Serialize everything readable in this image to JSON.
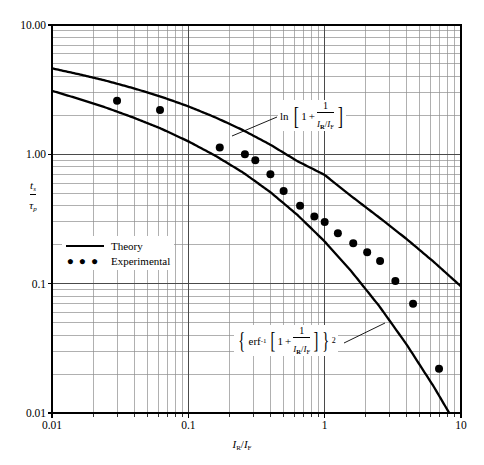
{
  "chart_data": {
    "type": "line",
    "title": "",
    "subtitle": "",
    "xlabel": "I_R/I_F",
    "ylabel": "t_s/tau_p",
    "xscale": "log",
    "yscale": "log",
    "xlim": [
      0.01,
      10
    ],
    "ylim": [
      0.01,
      10
    ],
    "grid": true,
    "grid_minor": true,
    "legend_position": "inside-left-center",
    "x_ticks": [
      "0.01",
      "0.1",
      "1",
      "10"
    ],
    "x_tick_values": [
      0.01,
      0.1,
      1,
      10
    ],
    "y_ticks": [
      "0.01",
      "0.1",
      "1.00",
      "10.00"
    ],
    "y_tick_values": [
      0.01,
      0.1,
      1.0,
      10.0
    ],
    "series": [
      {
        "name": "Theory",
        "kind": "line",
        "annotation": "ln[1 + 1/(I_R/I_F)]",
        "x": [
          0.01,
          0.0158,
          0.0251,
          0.0398,
          0.0631,
          0.1,
          0.158,
          0.251,
          0.398,
          0.631,
          1.0,
          1.58,
          2.51,
          3.98,
          6.31,
          10.0
        ],
        "y": [
          4.62,
          4.16,
          3.7,
          3.24,
          2.79,
          2.35,
          1.93,
          1.54,
          1.19,
          0.886,
          0.693,
          0.472,
          0.325,
          0.222,
          0.1474,
          0.0953
        ]
      },
      {
        "name": "Theory",
        "kind": "line",
        "annotation": "{erf^-1[1 + 1/(I_R/I_F)]}^2",
        "x": [
          0.01,
          0.0158,
          0.0251,
          0.0398,
          0.0631,
          0.1,
          0.158,
          0.251,
          0.398,
          0.631,
          1.0,
          1.58,
          2.51,
          3.98,
          6.31,
          10.0
        ],
        "y": [
          3.1,
          2.68,
          2.29,
          1.92,
          1.58,
          1.26,
          0.975,
          0.725,
          0.512,
          0.34,
          0.212,
          0.1235,
          0.0672,
          0.034,
          0.016,
          0.007
        ]
      },
      {
        "name": "Experimental",
        "kind": "scatter",
        "x": [
          0.03,
          0.062,
          0.17,
          0.26,
          0.31,
          0.4,
          0.5,
          0.66,
          0.84,
          1.0,
          1.25,
          1.62,
          2.05,
          2.55,
          3.3,
          4.45,
          6.9
        ],
        "y": [
          2.6,
          2.2,
          1.13,
          1.0,
          0.9,
          0.7,
          0.52,
          0.4,
          0.33,
          0.3,
          0.245,
          0.205,
          0.175,
          0.15,
          0.105,
          0.07,
          0.022
        ]
      }
    ],
    "annotations": [
      {
        "name": "upper-curve-formula",
        "latex": "ln[1 + 1/(I_R/I_F)]",
        "parts": {
          "fn": "ln",
          "bracket_open": "[",
          "one": "1",
          "plus": "+",
          "num": "1",
          "den_I": "I",
          "den_R": "R",
          "den_slash": "/",
          "den_I2": "I",
          "den_F": "F",
          "bracket_close": "]"
        }
      },
      {
        "name": "lower-curve-formula",
        "latex": "{erf^{-1}[1 + 1/(I_R/I_F)]}^2",
        "parts": {
          "brace_open": "{",
          "fn": "erf",
          "inv": "-1",
          "bracket_open": "[",
          "one": "1",
          "plus": "+",
          "num": "1",
          "den_I": "I",
          "den_R": "R",
          "den_slash": "/",
          "den_I2": "I",
          "den_F": "F",
          "bracket_close": "]",
          "brace_close": "}",
          "exp": "2"
        }
      }
    ]
  },
  "axes": {
    "y_title": {
      "num_var": "t",
      "num_sub": "s",
      "den_var": "τ",
      "den_sub": "p"
    },
    "x_title": {
      "i1": "I",
      "sub1": "R",
      "slash": "/",
      "i2": "I",
      "sub2": "F"
    },
    "y_tick_labels": [
      "10.00",
      "1.00",
      "0.1",
      "0.01"
    ],
    "x_tick_labels": [
      "0.01",
      "0.1",
      "1",
      "10"
    ]
  },
  "legend": {
    "items": [
      {
        "label": "Theory",
        "marker": "line"
      },
      {
        "label": "Experimental",
        "marker": "dots"
      }
    ]
  },
  "colors": {
    "ink": "#000000",
    "grid_major": "#4a4a4a",
    "grid_minor": "#8f8f8f",
    "background": "#ffffff"
  }
}
